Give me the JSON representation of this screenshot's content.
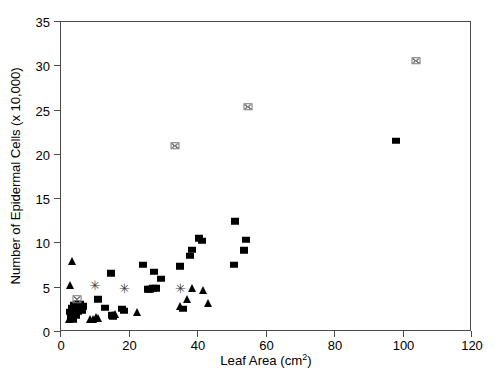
{
  "chart_data": {
    "type": "scatter",
    "title": "",
    "xlabel": "Leaf Area (cm",
    "xlabel_sup": "2",
    "xlabel_tail": ")",
    "ylabel": "Number of Epidermal Cells (x 10,000)",
    "xlim": [
      0,
      120
    ],
    "ylim": [
      0,
      35
    ],
    "xticks": [
      0,
      20,
      40,
      60,
      80,
      100,
      120
    ],
    "yticks": [
      0,
      5,
      10,
      15,
      20,
      25,
      30,
      35
    ],
    "grid": false,
    "legend": "none",
    "series": [
      {
        "name": "filled-square",
        "marker": "square",
        "points": [
          [
            3.0,
            2.2
          ],
          [
            3.2,
            1.6
          ],
          [
            3.5,
            2.6
          ],
          [
            3.8,
            1.3
          ],
          [
            4.0,
            2.0
          ],
          [
            4.2,
            2.9
          ],
          [
            4.4,
            2.3
          ],
          [
            4.6,
            1.7
          ],
          [
            4.8,
            2.6
          ],
          [
            5.0,
            3.1
          ],
          [
            5.2,
            2.2
          ],
          [
            5.4,
            2.8
          ],
          [
            5.6,
            2.4
          ],
          [
            5.8,
            3.0
          ],
          [
            6.0,
            2.6
          ],
          [
            6.3,
            2.3
          ],
          [
            6.6,
            2.8
          ],
          [
            11.2,
            3.6
          ],
          [
            13.0,
            2.6
          ],
          [
            15.0,
            6.5
          ],
          [
            15.3,
            1.8
          ],
          [
            15.6,
            1.6
          ],
          [
            18.2,
            2.5
          ],
          [
            18.8,
            2.3
          ],
          [
            24.3,
            7.5
          ],
          [
            25.8,
            4.7
          ],
          [
            26.3,
            4.7
          ],
          [
            27.2,
            4.8
          ],
          [
            27.4,
            6.7
          ],
          [
            28.0,
            4.8
          ],
          [
            29.5,
            5.9
          ],
          [
            35.0,
            7.3
          ],
          [
            36.0,
            2.5
          ],
          [
            38.0,
            8.5
          ],
          [
            38.6,
            9.2
          ],
          [
            40.6,
            10.5
          ],
          [
            41.4,
            10.2
          ],
          [
            50.8,
            7.5
          ],
          [
            51.2,
            12.4
          ],
          [
            53.6,
            9.1
          ],
          [
            54.4,
            10.3
          ],
          [
            98.0,
            21.5
          ]
        ]
      },
      {
        "name": "filled-triangle",
        "marker": "triangle",
        "points": [
          [
            2.5,
            1.4
          ],
          [
            3.0,
            5.2
          ],
          [
            3.4,
            7.9
          ],
          [
            8.8,
            1.3
          ],
          [
            9.6,
            1.4
          ],
          [
            10.4,
            1.6
          ],
          [
            11.2,
            1.5
          ],
          [
            15.4,
            1.8
          ],
          [
            16.2,
            1.9
          ],
          [
            22.5,
            2.2
          ],
          [
            35.0,
            2.8
          ],
          [
            37.0,
            3.6
          ],
          [
            38.4,
            4.8
          ],
          [
            41.8,
            4.6
          ],
          [
            43.2,
            3.2
          ]
        ]
      },
      {
        "name": "asterisk",
        "marker": "asterisk",
        "points": [
          [
            10.2,
            5.2
          ],
          [
            18.8,
            4.8
          ],
          [
            35.2,
            4.9
          ]
        ]
      },
      {
        "name": "crossed-open-square",
        "marker": "crosssquare",
        "points": [
          [
            5.0,
            3.6
          ],
          [
            33.5,
            20.9
          ],
          [
            55.0,
            25.3
          ],
          [
            104.0,
            30.5
          ]
        ]
      }
    ]
  },
  "axes": {
    "x_tick_labels": [
      "0",
      "20",
      "40",
      "60",
      "80",
      "100",
      "120"
    ],
    "y_tick_labels": [
      "0",
      "5",
      "10",
      "15",
      "20",
      "25",
      "30",
      "35"
    ],
    "x_title": "Leaf Area (cm",
    "x_title_sup": "2",
    "x_title_tail": ")",
    "y_title": "Number of Epidermal Cells (x 10,000)"
  },
  "colors": {
    "marker_fill": "#000000",
    "open_marker": "#777777",
    "axis": "#4a4a4a",
    "background": "#ffffff"
  }
}
